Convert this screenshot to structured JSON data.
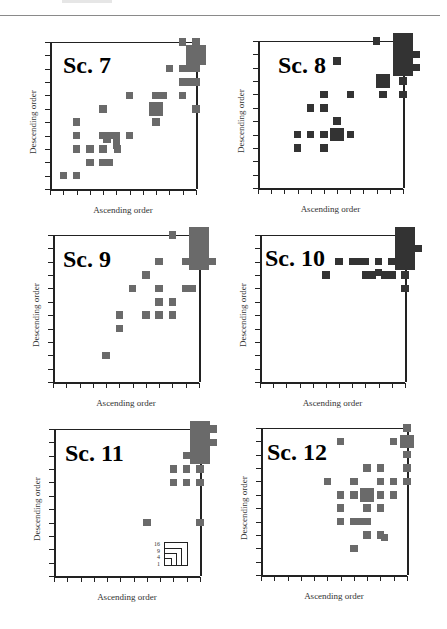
{
  "page": {
    "header_rule": true
  },
  "chart_data": [
    {
      "type": "scatter",
      "title": "Sc. 7",
      "xlabel": "Ascending order",
      "ylabel": "Descending order",
      "xlim": [
        0,
        11
      ],
      "ylim": [
        0,
        11
      ],
      "grid": false,
      "color": "#6a6a6a",
      "marker_shape": "square (area proportional to count)",
      "points": [
        {
          "x": 1,
          "y": 1,
          "size": 1
        },
        {
          "x": 2,
          "y": 1,
          "size": 1
        },
        {
          "x": 3,
          "y": 2,
          "size": 1
        },
        {
          "x": 4,
          "y": 2,
          "size": 1
        },
        {
          "x": 4.5,
          "y": 2,
          "size": 1
        },
        {
          "x": 2,
          "y": 3,
          "size": 1
        },
        {
          "x": 3,
          "y": 3,
          "size": 1
        },
        {
          "x": 4,
          "y": 3,
          "size": 1
        },
        {
          "x": 5,
          "y": 3.3,
          "size": 1
        },
        {
          "x": 5.1,
          "y": 3,
          "size": 1
        },
        {
          "x": 2,
          "y": 4,
          "size": 1
        },
        {
          "x": 4,
          "y": 4,
          "size": 1
        },
        {
          "x": 4.5,
          "y": 4,
          "size": 1
        },
        {
          "x": 5,
          "y": 4,
          "size": 1
        },
        {
          "x": 4.3,
          "y": 3.7,
          "size": 1
        },
        {
          "x": 5,
          "y": 3.7,
          "size": 1
        },
        {
          "x": 6,
          "y": 4,
          "size": 1
        },
        {
          "x": 2,
          "y": 5,
          "size": 1
        },
        {
          "x": 4,
          "y": 6,
          "size": 1
        },
        {
          "x": 6,
          "y": 7,
          "size": 1
        },
        {
          "x": 8,
          "y": 7,
          "size": 1
        },
        {
          "x": 8.5,
          "y": 7,
          "size": 1
        },
        {
          "x": 8,
          "y": 6,
          "size": 4
        },
        {
          "x": 8,
          "y": 5,
          "size": 1
        },
        {
          "x": 10,
          "y": 7,
          "size": 1
        },
        {
          "x": 11,
          "y": 6,
          "size": 1
        },
        {
          "x": 10,
          "y": 8,
          "size": 1
        },
        {
          "x": 10.5,
          "y": 8,
          "size": 1
        },
        {
          "x": 11,
          "y": 8,
          "size": 1
        },
        {
          "x": 9,
          "y": 9,
          "size": 1
        },
        {
          "x": 10,
          "y": 9,
          "size": 1
        },
        {
          "x": 10.5,
          "y": 9,
          "size": 1
        },
        {
          "x": 11,
          "y": 9,
          "size": 1
        },
        {
          "x": 11,
          "y": 10,
          "size": 9
        },
        {
          "x": 10,
          "y": 11,
          "size": 1
        },
        {
          "x": 11,
          "y": 11,
          "size": 1
        }
      ]
    },
    {
      "type": "scatter",
      "title": "Sc. 8",
      "xlabel": "Ascending order",
      "ylabel": "Descending order",
      "xlim": [
        0,
        11
      ],
      "ylim": [
        0,
        11
      ],
      "grid": false,
      "color": "#333333",
      "marker_shape": "square (area proportional to count)",
      "points": [
        {
          "x": 3,
          "y": 3,
          "size": 1
        },
        {
          "x": 5,
          "y": 3,
          "size": 1
        },
        {
          "x": 3,
          "y": 4,
          "size": 1
        },
        {
          "x": 4,
          "y": 4,
          "size": 1
        },
        {
          "x": 5,
          "y": 4,
          "size": 1
        },
        {
          "x": 6,
          "y": 4,
          "size": 4
        },
        {
          "x": 7,
          "y": 4,
          "size": 1
        },
        {
          "x": 6,
          "y": 5,
          "size": 1
        },
        {
          "x": 4,
          "y": 6,
          "size": 1
        },
        {
          "x": 5,
          "y": 6,
          "size": 1
        },
        {
          "x": 5,
          "y": 7,
          "size": 1
        },
        {
          "x": 7,
          "y": 7,
          "size": 1
        },
        {
          "x": 6,
          "y": 9.5,
          "size": 1
        },
        {
          "x": 9.5,
          "y": 7,
          "size": 1
        },
        {
          "x": 11,
          "y": 7,
          "size": 1
        },
        {
          "x": 9.5,
          "y": 8,
          "size": 4
        },
        {
          "x": 11,
          "y": 8,
          "size": 1
        },
        {
          "x": 11,
          "y": 10,
          "size": 16
        },
        {
          "x": 12,
          "y": 9,
          "size": 1
        },
        {
          "x": 12,
          "y": 10,
          "size": 1
        },
        {
          "x": 9,
          "y": 11,
          "size": 1
        },
        {
          "x": 11,
          "y": 11,
          "size": 1
        }
      ]
    },
    {
      "type": "scatter",
      "title": "Sc. 9",
      "xlabel": "Ascending order",
      "ylabel": "Descending order",
      "xlim": [
        0,
        11
      ],
      "ylim": [
        0,
        11
      ],
      "grid": false,
      "color": "#6a6a6a",
      "marker_shape": "square (area proportional to count)",
      "points": [
        {
          "x": 4,
          "y": 2,
          "size": 1
        },
        {
          "x": 5,
          "y": 4,
          "size": 1
        },
        {
          "x": 5,
          "y": 5,
          "size": 1
        },
        {
          "x": 7,
          "y": 5,
          "size": 1
        },
        {
          "x": 8,
          "y": 5,
          "size": 1
        },
        {
          "x": 9,
          "y": 5,
          "size": 1
        },
        {
          "x": 8,
          "y": 6,
          "size": 1
        },
        {
          "x": 9,
          "y": 6,
          "size": 1
        },
        {
          "x": 6,
          "y": 7,
          "size": 1
        },
        {
          "x": 8,
          "y": 7,
          "size": 1
        },
        {
          "x": 7,
          "y": 8,
          "size": 1
        },
        {
          "x": 8,
          "y": 9,
          "size": 1
        },
        {
          "x": 10,
          "y": 9,
          "size": 1
        },
        {
          "x": 10,
          "y": 7,
          "size": 1
        },
        {
          "x": 10.5,
          "y": 7,
          "size": 1
        },
        {
          "x": 9,
          "y": 11,
          "size": 1
        },
        {
          "x": 11,
          "y": 10,
          "size": 16
        },
        {
          "x": 12,
          "y": 9,
          "size": 1
        }
      ]
    },
    {
      "type": "scatter",
      "title": "Sc. 10",
      "xlabel": "Ascending order",
      "ylabel": "Descending order",
      "xlim": [
        0,
        11
      ],
      "ylim": [
        0,
        11
      ],
      "grid": false,
      "color": "#333333",
      "marker_shape": "square (area proportional to count)",
      "points": [
        {
          "x": 5,
          "y": 8,
          "size": 1
        },
        {
          "x": 6,
          "y": 9,
          "size": 1
        },
        {
          "x": 7,
          "y": 9,
          "size": 1
        },
        {
          "x": 7.5,
          "y": 9,
          "size": 1
        },
        {
          "x": 8,
          "y": 9,
          "size": 1
        },
        {
          "x": 9,
          "y": 9,
          "size": 1
        },
        {
          "x": 10,
          "y": 9,
          "size": 1
        },
        {
          "x": 8,
          "y": 8,
          "size": 1
        },
        {
          "x": 8.5,
          "y": 8,
          "size": 1
        },
        {
          "x": 9,
          "y": 8.2,
          "size": 1
        },
        {
          "x": 9.5,
          "y": 8,
          "size": 1
        },
        {
          "x": 10,
          "y": 8,
          "size": 1
        },
        {
          "x": 11,
          "y": 8,
          "size": 1
        },
        {
          "x": 11,
          "y": 7,
          "size": 1
        },
        {
          "x": 11,
          "y": 10,
          "size": 16
        },
        {
          "x": 12,
          "y": 10,
          "size": 1
        }
      ]
    },
    {
      "type": "scatter",
      "title": "Sc. 11",
      "xlabel": "Ascending order",
      "ylabel": "Descending order",
      "xlim": [
        0,
        11
      ],
      "ylim": [
        0,
        11
      ],
      "grid": false,
      "color": "#6a6a6a",
      "marker_shape": "square (area proportional to count)",
      "legend": {
        "title": "",
        "entries": [
          "16",
          "9",
          "4",
          "1"
        ],
        "position": "lower right"
      },
      "points": [
        {
          "x": 7,
          "y": 4,
          "size": 1
        },
        {
          "x": 11,
          "y": 4,
          "size": 1
        },
        {
          "x": 9,
          "y": 7,
          "size": 1
        },
        {
          "x": 10,
          "y": 7,
          "size": 1
        },
        {
          "x": 11,
          "y": 7,
          "size": 1
        },
        {
          "x": 9,
          "y": 8,
          "size": 1
        },
        {
          "x": 10,
          "y": 8,
          "size": 1
        },
        {
          "x": 11,
          "y": 8,
          "size": 1
        },
        {
          "x": 10,
          "y": 9,
          "size": 1
        },
        {
          "x": 11,
          "y": 10,
          "size": 16
        },
        {
          "x": 12,
          "y": 10,
          "size": 1
        },
        {
          "x": 12,
          "y": 11,
          "size": 1
        }
      ]
    },
    {
      "type": "scatter",
      "title": "Sc. 12",
      "xlabel": "Ascending order",
      "ylabel": "Descending order",
      "xlim": [
        0,
        11
      ],
      "ylim": [
        0,
        11
      ],
      "grid": false,
      "color": "#6a6a6a",
      "marker_shape": "square (area proportional to count)",
      "points": [
        {
          "x": 7,
          "y": 2,
          "size": 1
        },
        {
          "x": 8,
          "y": 3,
          "size": 1
        },
        {
          "x": 9,
          "y": 3,
          "size": 1
        },
        {
          "x": 9.3,
          "y": 2.8,
          "size": 1
        },
        {
          "x": 6,
          "y": 4,
          "size": 1
        },
        {
          "x": 7,
          "y": 4,
          "size": 1
        },
        {
          "x": 7.5,
          "y": 4,
          "size": 1
        },
        {
          "x": 8,
          "y": 4,
          "size": 1
        },
        {
          "x": 6,
          "y": 5,
          "size": 1
        },
        {
          "x": 8,
          "y": 5,
          "size": 1
        },
        {
          "x": 9,
          "y": 5,
          "size": 1
        },
        {
          "x": 6,
          "y": 6,
          "size": 1
        },
        {
          "x": 7,
          "y": 6,
          "size": 1
        },
        {
          "x": 8,
          "y": 6,
          "size": 4
        },
        {
          "x": 9,
          "y": 6,
          "size": 1
        },
        {
          "x": 10,
          "y": 6,
          "size": 1
        },
        {
          "x": 5,
          "y": 7,
          "size": 1
        },
        {
          "x": 7,
          "y": 7,
          "size": 1
        },
        {
          "x": 9,
          "y": 7,
          "size": 1
        },
        {
          "x": 10,
          "y": 7,
          "size": 1
        },
        {
          "x": 8,
          "y": 8,
          "size": 1
        },
        {
          "x": 9,
          "y": 8,
          "size": 1
        },
        {
          "x": 6,
          "y": 10,
          "size": 1
        },
        {
          "x": 10,
          "y": 10,
          "size": 1
        },
        {
          "x": 11,
          "y": 7,
          "size": 1
        },
        {
          "x": 11,
          "y": 8,
          "size": 1
        },
        {
          "x": 11,
          "y": 9,
          "size": 1
        },
        {
          "x": 11,
          "y": 10,
          "size": 4
        },
        {
          "x": 11,
          "y": 11,
          "size": 1
        }
      ]
    }
  ],
  "panels": [
    {
      "title": "Sc. 7",
      "xlabel": "Ascending order",
      "ylabel": "Descending order"
    },
    {
      "title": "Sc. 8",
      "xlabel": "Ascending order",
      "ylabel": "Descending order"
    },
    {
      "title": "Sc. 9",
      "xlabel": "Ascending order",
      "ylabel": "Descending order"
    },
    {
      "title": "Sc. 10",
      "xlabel": "Ascending order",
      "ylabel": "Descending order"
    },
    {
      "title": "Sc. 11",
      "xlabel": "Ascending order",
      "ylabel": "Descending order"
    },
    {
      "title": "Sc. 12",
      "xlabel": "Ascending order",
      "ylabel": "Descending order"
    }
  ],
  "legend": {
    "labels": [
      "16",
      "9",
      "4",
      "1"
    ]
  },
  "colors": {
    "mid_grey": "#6a6a6a",
    "dark_grey": "#333333",
    "axis": "#222222"
  }
}
